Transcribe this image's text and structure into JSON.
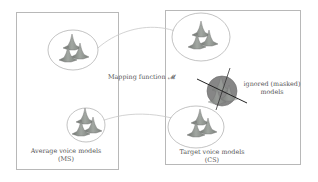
{
  "diagram": {
    "left_panel": {
      "label_line1": "Average voice models",
      "label_line2": "(MS)"
    },
    "right_panel": {
      "label_line1": "Target voice models",
      "label_line2": "(CS)"
    },
    "mapping": {
      "label": "Mapping function 𝓜"
    },
    "ignored": {
      "label_line1": "ignored (masked)",
      "label_line2": "models"
    },
    "colors": {
      "frame": "#b8b8b8",
      "ellipse": "#9a9a9a",
      "connector": "#c8c8c8",
      "gaussian": "#8a8f8a",
      "masked_fill": "#7d7d7d",
      "cross": "#222222"
    }
  }
}
